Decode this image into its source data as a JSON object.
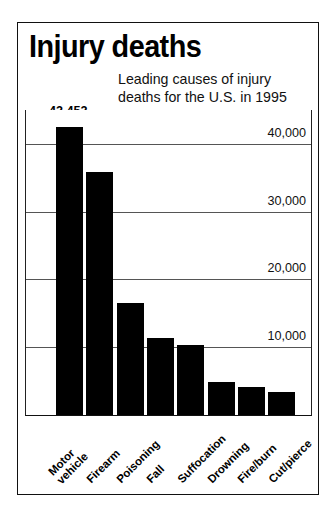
{
  "title": "Injury deaths",
  "subtitle": {
    "line1": "Leading causes of injury",
    "line2": "deaths for the U.S. in 1995"
  },
  "callouts": {
    "max_value_label": "42,452",
    "min_value_label": "3,367"
  },
  "chart_data": {
    "type": "bar",
    "title": "Injury deaths",
    "subtitle": "Leading causes of injury deaths for the U.S. in 1995",
    "xlabel": "",
    "ylabel": "",
    "ylim": [
      0,
      45000
    ],
    "grid": true,
    "legend": "none",
    "bar_color": "#000000",
    "yticks": [
      10000,
      20000,
      30000,
      40000
    ],
    "ytick_labels": [
      "10,000",
      "20,000",
      "30,000",
      "40,000"
    ],
    "categories": [
      "Motor vehicle",
      "Firearm",
      "Poisoning",
      "Fall",
      "Suffocation",
      "Drowning",
      "Fire/burn",
      "Cut/pierce"
    ],
    "category_lines": [
      [
        "Motor",
        "vehicle"
      ],
      [
        "Firearm"
      ],
      [
        "Poisoning"
      ],
      [
        "Fall"
      ],
      [
        "Suffocation"
      ],
      [
        "Drowning"
      ],
      [
        "Fire/burn"
      ],
      [
        "Cut/pierce"
      ]
    ],
    "values": [
      42452,
      35900,
      16500,
      11400,
      10400,
      4800,
      4100,
      3367
    ],
    "data_labels": [
      "42,452",
      "",
      "",
      "",
      "",
      "",
      "",
      "3,367"
    ]
  }
}
